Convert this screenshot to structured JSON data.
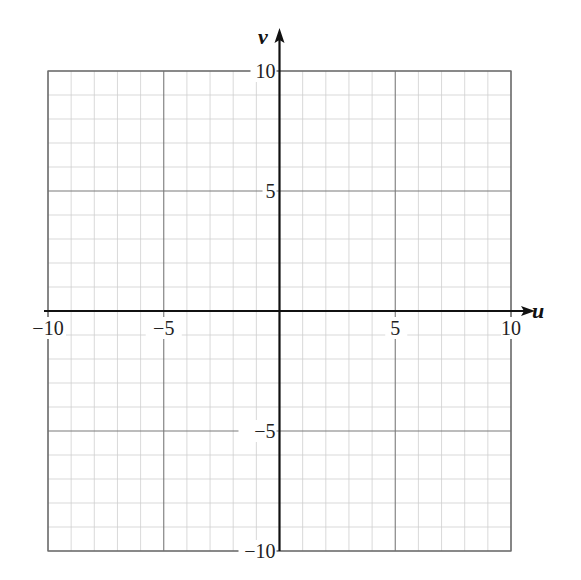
{
  "chart_data": {
    "type": "line",
    "title": "",
    "xlabel": "u",
    "ylabel": "v",
    "xlim": [
      -10,
      10
    ],
    "ylim": [
      -10,
      10
    ],
    "grid": true,
    "grid_minor_step": 1,
    "grid_major_step": 5,
    "x_ticks": [
      -10,
      -5,
      5,
      10
    ],
    "y_ticks": [
      10,
      5,
      -5,
      -10
    ],
    "x_tick_labels": [
      "−10",
      "−5",
      "5",
      "10"
    ],
    "y_tick_labels": [
      "10",
      "5",
      "−5",
      "−10"
    ],
    "series": [],
    "legend": null
  },
  "colors": {
    "axis": "#111111",
    "major_grid": "#7a7a7a",
    "minor_grid": "#cfcfcf",
    "border": "#6e6e6e"
  }
}
